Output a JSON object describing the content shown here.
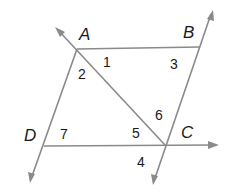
{
  "diagram": {
    "type": "parallelogram-with-diagonal",
    "points": {
      "A": {
        "label": "A",
        "x": 77,
        "y": 49
      },
      "B": {
        "label": "B",
        "x": 200,
        "y": 47
      },
      "C": {
        "label": "C",
        "x": 165,
        "y": 145
      },
      "D": {
        "label": "D",
        "x": 44,
        "y": 146
      }
    },
    "point_labels": [
      {
        "id": "A",
        "text": "A",
        "x": 79,
        "y": 40
      },
      {
        "id": "B",
        "text": "B",
        "x": 183,
        "y": 38
      },
      {
        "id": "C",
        "text": "C",
        "x": 181,
        "y": 138
      },
      {
        "id": "D",
        "text": "D",
        "x": 24,
        "y": 141
      }
    ],
    "angle_labels": [
      {
        "id": "1",
        "text": "1",
        "x": 103,
        "y": 67
      },
      {
        "id": "2",
        "text": "2",
        "x": 78,
        "y": 79
      },
      {
        "id": "3",
        "text": "3",
        "x": 170,
        "y": 69
      },
      {
        "id": "4",
        "text": "4",
        "x": 137,
        "y": 167
      },
      {
        "id": "5",
        "text": "5",
        "x": 132,
        "y": 138
      },
      {
        "id": "6",
        "text": "6",
        "x": 155,
        "y": 120
      },
      {
        "id": "7",
        "text": "7",
        "x": 60,
        "y": 139
      }
    ],
    "segments": [
      {
        "name": "segment-AB",
        "from": "A",
        "to": "B"
      },
      {
        "name": "line-AC-diagonal",
        "from": "C",
        "to": "A",
        "extends_to": [
          55,
          27
        ],
        "arrow": "end"
      },
      {
        "name": "line-BC",
        "from": "C",
        "to": "B",
        "extends_to": [
          213,
          10
        ],
        "arrow_up": true,
        "extends_down_to": [
          153,
          185
        ]
      },
      {
        "name": "line-AD",
        "from": "A",
        "to": "D",
        "extends_to": [
          30,
          183
        ],
        "arrow": "end"
      },
      {
        "name": "line-DC",
        "from": "D",
        "to": "C",
        "extends_to": [
          218,
          145
        ],
        "arrow": "end"
      }
    ],
    "colors": {
      "line": "#8a8a8a",
      "text": "#1a1a1a",
      "background": "#ffffff"
    }
  }
}
